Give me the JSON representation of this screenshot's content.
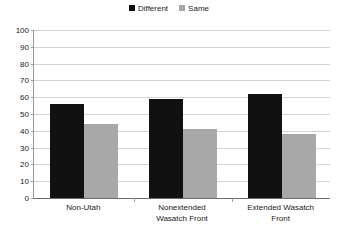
{
  "chart_data": {
    "type": "bar",
    "title": "",
    "subtitle": "",
    "xlabel": "",
    "ylabel": "",
    "categories": [
      "Non-Utah",
      "Nonextended Wasatch Front",
      "Extended Wasatch Front"
    ],
    "category_lines": [
      [
        "Non-Utah"
      ],
      [
        "Nonextended",
        "Wasatch Front"
      ],
      [
        "Extended Wasatch",
        "Front"
      ]
    ],
    "series": [
      {
        "name": "Different",
        "color": "#111111",
        "values": [
          56,
          59,
          62
        ]
      },
      {
        "name": "Same",
        "color": "#a8a8a8",
        "values": [
          44,
          41,
          38
        ]
      }
    ],
    "ylim": [
      0,
      100
    ],
    "ytick_step": 10,
    "yticks": [
      100,
      90,
      80,
      70,
      60,
      50,
      40,
      30,
      20,
      10,
      0
    ],
    "ytick_labels": [
      "100",
      "90",
      "80",
      "70",
      "60",
      "50",
      "40",
      "30",
      "20",
      "10",
      "0"
    ],
    "grid": true,
    "grid_axis": "y",
    "legend_position": "top-center",
    "legend": [
      {
        "label": "Different",
        "color": "#111111"
      },
      {
        "label": "Same",
        "color": "#a8a8a8"
      }
    ]
  },
  "colors": {
    "background": "#ffffff",
    "gridline": "#d4d4d4",
    "axis": "#9a9a9a",
    "baseline": "#6d6d6d",
    "text": "#1a1a1a",
    "series_different": "#111111",
    "series_same": "#a8a8a8"
  }
}
